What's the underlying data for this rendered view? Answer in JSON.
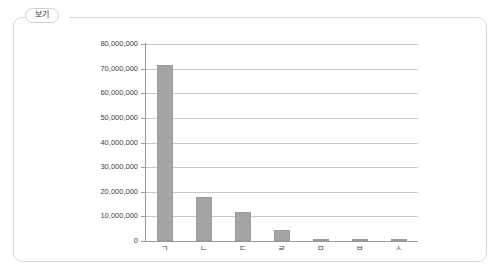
{
  "card": {
    "tab_label": "보기"
  },
  "chart_data": {
    "type": "bar",
    "title": "",
    "subtitle": "",
    "xlabel": "",
    "ylabel": "",
    "categories": [
      "ㄱ",
      "ㄴ",
      "ㄷ",
      "ㄹ",
      "ㅁ",
      "ㅂ",
      "ㅅ"
    ],
    "values": [
      71500000,
      17800000,
      11800000,
      4500000,
      350000,
      300000,
      250000
    ],
    "series": [
      {
        "name": "",
        "values": [
          71500000,
          17800000,
          11800000,
          4500000,
          350000,
          300000,
          250000
        ]
      }
    ],
    "ylim": [
      0,
      80000000
    ],
    "ytick_values": [
      0,
      10000000,
      20000000,
      30000000,
      40000000,
      50000000,
      60000000,
      70000000,
      80000000
    ],
    "ytick_labels": [
      "0",
      "10,000,000",
      "20,000,000",
      "30,000,000",
      "40,000,000",
      "50,000,000",
      "60,000,000",
      "70,000,000",
      "80,000,000"
    ],
    "grid": true,
    "grid_axis": "y",
    "legend": false,
    "legend_position": "none",
    "bar_color": "#a4a4a4",
    "grid_color": "#c9c9c9",
    "axis_color": "#9a9a9a",
    "text_color": "#3f3f3f",
    "background": "#ffffff"
  }
}
